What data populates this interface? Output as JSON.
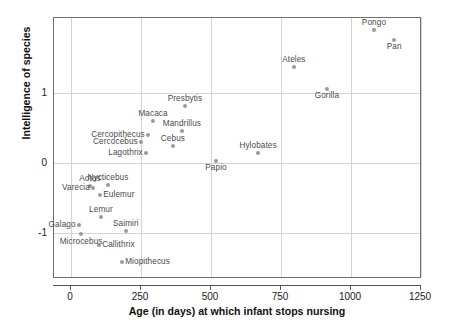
{
  "chart_data": {
    "type": "scatter",
    "title": "",
    "xlabel": "Age (in days) at which infant stops nursing",
    "ylabel": "Intelligence of species",
    "xlim": [
      -50,
      1265
    ],
    "ylim": [
      -1.65,
      2.07
    ],
    "xticks": [
      0,
      250,
      500,
      750,
      1000,
      1250
    ],
    "xticklabels": [
      "0",
      "250",
      "500",
      "750",
      "1000",
      "1250"
    ],
    "yticks": [
      1,
      0,
      -1
    ],
    "yticklabels": [
      "1",
      "0",
      "-1"
    ],
    "grid": "both",
    "legend": "none",
    "marker_color": "#9a9a9a",
    "label_color": "#4a4a4a",
    "points": [
      {
        "name": "Pongo",
        "x": 1082,
        "y": 1.9,
        "label_pos": "a"
      },
      {
        "name": "Pan",
        "x": 1154,
        "y": 1.76,
        "label_pos": "b"
      },
      {
        "name": "Ateles",
        "x": 796,
        "y": 1.37,
        "label_pos": "a"
      },
      {
        "name": "Gorilla",
        "x": 914,
        "y": 1.06,
        "label_pos": "b"
      },
      {
        "name": "Presbytis",
        "x": 407,
        "y": 0.81,
        "label_pos": "a"
      },
      {
        "name": "Macaca",
        "x": 293,
        "y": 0.6,
        "label_pos": "a"
      },
      {
        "name": "Mandrillus",
        "x": 396,
        "y": 0.46,
        "label_pos": "a"
      },
      {
        "name": "Cercopithecus",
        "x": 275,
        "y": 0.4,
        "label_pos": "r"
      },
      {
        "name": "Cercocebus",
        "x": 250,
        "y": 0.3,
        "label_pos": "r"
      },
      {
        "name": "Cebus",
        "x": 364,
        "y": 0.24,
        "label_pos": "a"
      },
      {
        "name": "Lagothrix",
        "x": 268,
        "y": 0.14,
        "label_pos": "r"
      },
      {
        "name": "Hylobates",
        "x": 668,
        "y": 0.14,
        "label_pos": "a"
      },
      {
        "name": "Papio",
        "x": 518,
        "y": 0.03,
        "label_pos": "b"
      },
      {
        "name": "Nycticebus",
        "x": 132,
        "y": -0.31,
        "label_pos": "a"
      },
      {
        "name": "Aotus",
        "x": 68,
        "y": -0.33,
        "label_pos": "a"
      },
      {
        "name": "Varecia",
        "x": 79,
        "y": -0.36,
        "label_pos": "r"
      },
      {
        "name": "Eulemur",
        "x": 104,
        "y": -0.46,
        "label_pos": "l"
      },
      {
        "name": "Lemur",
        "x": 107,
        "y": -0.77,
        "label_pos": "a"
      },
      {
        "name": "Galago",
        "x": 28,
        "y": -0.88,
        "label_pos": "r"
      },
      {
        "name": "Saimiri",
        "x": 196,
        "y": -0.97,
        "label_pos": "a"
      },
      {
        "name": "Microcebus",
        "x": 36,
        "y": -1.02,
        "label_pos": "b"
      },
      {
        "name": "Callithrix",
        "x": 100,
        "y": -1.17,
        "label_pos": "l"
      },
      {
        "name": "Miopithecus",
        "x": 182,
        "y": -1.42,
        "label_pos": "l"
      }
    ]
  }
}
